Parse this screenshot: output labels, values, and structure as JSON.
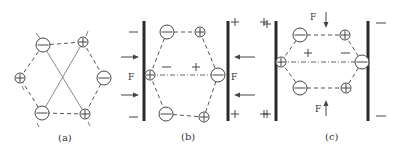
{
  "figure": {
    "colors": {
      "line": "#444444",
      "plate": "#2a2a2a",
      "background": "#ffffff"
    },
    "panels": [
      {
        "id": "a",
        "caption": "(a)",
        "ions": [
          {
            "charge": "-",
            "size": "large",
            "x": 43,
            "y": 45
          },
          {
            "charge": "+",
            "size": "small",
            "x": 83,
            "y": 42
          },
          {
            "charge": "+",
            "size": "small",
            "x": 20,
            "y": 78
          },
          {
            "charge": "-",
            "size": "large",
            "x": 104,
            "y": 78
          },
          {
            "charge": "-",
            "size": "large",
            "x": 42,
            "y": 113
          },
          {
            "charge": "+",
            "size": "small",
            "x": 85,
            "y": 114
          }
        ]
      },
      {
        "id": "b",
        "caption": "(b)",
        "force_label_left": "F",
        "force_label_right": "F",
        "surface_charges_left": [
          "−",
          "−"
        ],
        "surface_charges_right": [
          "+",
          "+",
          "+",
          "+"
        ],
        "internal_charges": [
          "−",
          "+"
        ],
        "ions": [
          {
            "charge": "-",
            "size": "large",
            "x": 167,
            "y": 32
          },
          {
            "charge": "+",
            "size": "small",
            "x": 200,
            "y": 32
          },
          {
            "charge": "+",
            "size": "small",
            "x": 150,
            "y": 75
          },
          {
            "charge": "-",
            "size": "large",
            "x": 218,
            "y": 75
          },
          {
            "charge": "-",
            "size": "large",
            "x": 166,
            "y": 114
          },
          {
            "charge": "+",
            "size": "small",
            "x": 204,
            "y": 117
          }
        ]
      },
      {
        "id": "c",
        "caption": "(c)",
        "force_label_top": "F",
        "force_label_bottom": "F",
        "surface_charges_left": [
          "+",
          "+"
        ],
        "surface_charges_right": [
          "−",
          "−"
        ],
        "internal_charges": [
          "+",
          "−"
        ],
        "ions": [
          {
            "charge": "-",
            "size": "large",
            "x": 300,
            "y": 35
          },
          {
            "charge": "+",
            "size": "small",
            "x": 345,
            "y": 35
          },
          {
            "charge": "+",
            "size": "small",
            "x": 281,
            "y": 62
          },
          {
            "charge": "-",
            "size": "large",
            "x": 362,
            "y": 62
          },
          {
            "charge": "-",
            "size": "large",
            "x": 300,
            "y": 88
          },
          {
            "charge": "+",
            "size": "small",
            "x": 346,
            "y": 88
          }
        ]
      }
    ]
  }
}
